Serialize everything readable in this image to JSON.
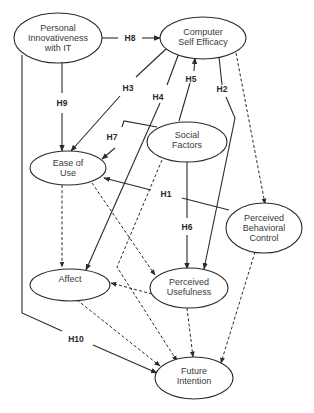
{
  "diagram": {
    "type": "structural-model",
    "colors": {
      "stroke": "#2a2a2a",
      "text": "#3a3a3a",
      "background": "#ffffff"
    },
    "nodes": [
      {
        "id": "pi",
        "lines": [
          "Personal",
          "Innovativeness",
          "with IT"
        ]
      },
      {
        "id": "cse",
        "lines": [
          "Computer",
          "Self Efficacy"
        ]
      },
      {
        "id": "sf",
        "lines": [
          "Social",
          "Factors"
        ]
      },
      {
        "id": "eou",
        "lines": [
          "Ease of",
          "Use"
        ]
      },
      {
        "id": "pbc",
        "lines": [
          "Perceived",
          "Behavioral",
          "Control"
        ]
      },
      {
        "id": "aff",
        "lines": [
          "Affect"
        ]
      },
      {
        "id": "pu",
        "lines": [
          "Perceived",
          "Usefulness"
        ]
      },
      {
        "id": "fi",
        "lines": [
          "Future",
          "Intention"
        ]
      }
    ],
    "edges": [
      {
        "from": "pi",
        "to": "cse",
        "label": "H8",
        "style": "solid"
      },
      {
        "from": "pi",
        "to": "eou",
        "label": "H9",
        "style": "solid"
      },
      {
        "from": "cse",
        "to": "eou",
        "label": "H3",
        "style": "solid"
      },
      {
        "from": "cse",
        "to": "aff",
        "label": "H4",
        "style": "solid"
      },
      {
        "from": "sf",
        "to": "cse",
        "label": "H5",
        "style": "solid"
      },
      {
        "from": "cse",
        "to": "pu",
        "label": "H2",
        "style": "solid"
      },
      {
        "from": "sf",
        "to": "eou",
        "label": "H7",
        "style": "solid"
      },
      {
        "from": "pbc",
        "to": "eou",
        "label": "H1",
        "style": "solid"
      },
      {
        "from": "sf",
        "to": "pu",
        "label": "H6",
        "style": "solid"
      },
      {
        "from": "pi",
        "to": "fi",
        "label": "H10",
        "style": "solid"
      },
      {
        "from": "cse",
        "to": "pbc",
        "label": "",
        "style": "dashed"
      },
      {
        "from": "eou",
        "to": "aff",
        "label": "",
        "style": "dashed"
      },
      {
        "from": "eou",
        "to": "pu",
        "label": "",
        "style": "dashed"
      },
      {
        "from": "pu",
        "to": "aff",
        "label": "",
        "style": "dashed"
      },
      {
        "from": "aff",
        "to": "fi",
        "label": "",
        "style": "dashed"
      },
      {
        "from": "pu",
        "to": "fi",
        "label": "",
        "style": "dashed"
      },
      {
        "from": "pbc",
        "to": "fi",
        "label": "",
        "style": "dashed"
      },
      {
        "from": "sf",
        "to": "fi",
        "label": "",
        "style": "dashed"
      }
    ],
    "edge_labels": {
      "h1": "H1",
      "h2": "H2",
      "h3": "H3",
      "h4": "H4",
      "h5": "H5",
      "h6": "H6",
      "h7": "H7",
      "h8": "H8",
      "h9": "H9",
      "h10": "H10"
    }
  }
}
